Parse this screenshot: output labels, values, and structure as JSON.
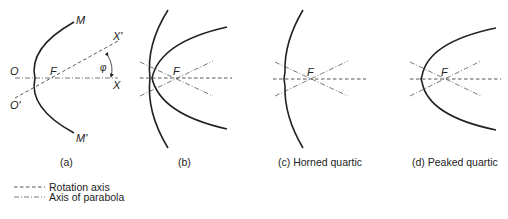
{
  "panels": {
    "a": {
      "caption": "(a)",
      "labels": {
        "M": "M",
        "M_prime": "M'",
        "O": "O",
        "O_prime": "O'",
        "F": "F",
        "X": "X",
        "X_prime": "X'",
        "phi": "φ"
      }
    },
    "b": {
      "caption": "(b)",
      "labels": {
        "F": "F"
      }
    },
    "c": {
      "caption": "(c) Horned quartic",
      "labels": {
        "F": "F"
      }
    },
    "d": {
      "caption": "(d) Peaked quartic",
      "labels": {
        "F": "F"
      }
    }
  },
  "legend": {
    "items": [
      {
        "style": "dashed",
        "label": "Rotation axis"
      },
      {
        "style": "dash-dot",
        "label": "Axis of parabola"
      }
    ]
  }
}
